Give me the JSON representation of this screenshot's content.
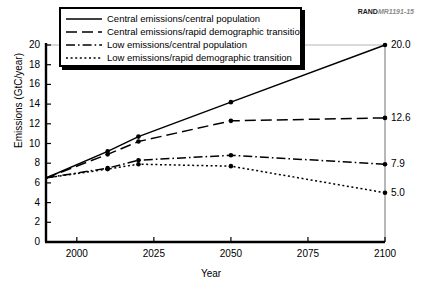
{
  "watermark": {
    "brand": "RAND",
    "code": "MR1191-15"
  },
  "chart_data": {
    "type": "line",
    "title": "",
    "xlabel": "Year",
    "ylabel": "Emissions (GtC/year)",
    "xlim": [
      1990,
      2100
    ],
    "ylim": [
      0,
      20
    ],
    "xticks": [
      2000,
      2025,
      2050,
      2075,
      2100
    ],
    "yticks": [
      0,
      2,
      4,
      6,
      8,
      10,
      12,
      14,
      16,
      18,
      20
    ],
    "grid": false,
    "legend_position": "top-left",
    "x": [
      1990,
      2010,
      2020,
      2050,
      2100
    ],
    "series": [
      {
        "name": "Central emissions/central population",
        "style": "solid",
        "values": [
          6.5,
          9.2,
          10.7,
          14.2,
          20.0
        ],
        "end_label": "20.0"
      },
      {
        "name": "Central emissions/rapid demographic transition",
        "style": "long-dash",
        "values": [
          6.5,
          8.9,
          10.2,
          12.3,
          12.6
        ],
        "end_label": "12.6"
      },
      {
        "name": "Low emissions/central population",
        "style": "dash-dot",
        "values": [
          6.5,
          7.5,
          8.3,
          8.8,
          7.9
        ],
        "end_label": "7.9"
      },
      {
        "name": "Low emissions/rapid demographic transition",
        "style": "dotted",
        "values": [
          6.5,
          7.4,
          7.9,
          7.7,
          5.0
        ],
        "end_label": "5.0"
      }
    ]
  }
}
